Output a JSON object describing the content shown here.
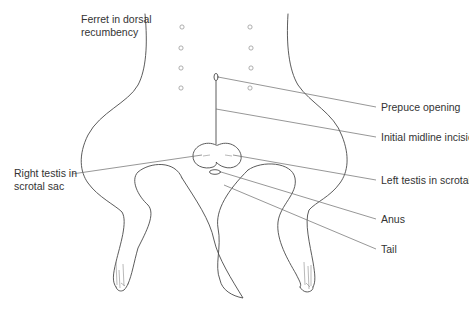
{
  "diagram": {
    "title": "Ferret in dorsal recumbency",
    "title_lines": [
      "Ferret in dorsal",
      "recumbency"
    ],
    "labels": {
      "prepuce_opening": "Prepuce opening",
      "initial_midline_incision": "Initial midline incision",
      "right_testis_lines": [
        "Right testis in",
        "scrotal sac"
      ],
      "left_testis": "Left testis in scrotal sac",
      "anus": "Anus",
      "tail": "Tail"
    },
    "port_markers": {
      "count": 8,
      "layout": "two columns of four"
    },
    "colors": {
      "outline": "#4a4a4a",
      "leader_line": "#6a6a6a",
      "text": "#333333",
      "background": "#ffffff"
    }
  }
}
